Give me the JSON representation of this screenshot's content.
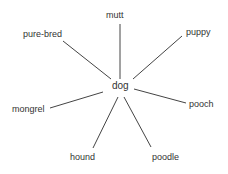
{
  "diagram": {
    "type": "word-web",
    "center": {
      "label": "dog",
      "x": 122,
      "y": 86
    },
    "line_color": "#444444",
    "nodes": [
      {
        "label": "mutt",
        "x": 106,
        "y": 10,
        "line": [
          120,
          24,
          120,
          79
        ]
      },
      {
        "label": "pure-bred",
        "x": 23,
        "y": 29,
        "line": [
          63,
          41,
          111,
          79
        ]
      },
      {
        "label": "puppy",
        "x": 186,
        "y": 27,
        "line": [
          182,
          36,
          133,
          79
        ]
      },
      {
        "label": "mongrel",
        "x": 12,
        "y": 104,
        "line": [
          50,
          108,
          103,
          92
        ]
      },
      {
        "label": "pooch",
        "x": 189,
        "y": 99,
        "line": [
          134,
          89,
          186,
          103
        ]
      },
      {
        "label": "hound",
        "x": 70,
        "y": 152,
        "line": [
          93,
          148,
          118,
          97
        ]
      },
      {
        "label": "poodle",
        "x": 152,
        "y": 152,
        "line": [
          151,
          147,
          124,
          97
        ]
      }
    ]
  }
}
